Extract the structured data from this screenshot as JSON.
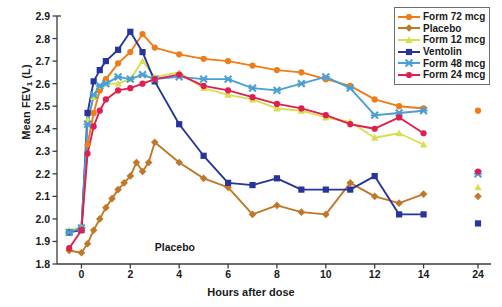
{
  "chart_data": {
    "type": "line",
    "title": "",
    "xlabel": "Hours after dose",
    "ylabel": "Mean FEV1 (L)",
    "ylabel_plain": "Mean FEV",
    "ylabel_sub": "1",
    "ylabel_unit": " (L)",
    "ylim": [
      1.8,
      2.9
    ],
    "yticks": [
      1.8,
      1.9,
      2.0,
      2.1,
      2.2,
      2.3,
      2.4,
      2.5,
      2.6,
      2.7,
      2.8,
      2.9
    ],
    "ytick_labels": [
      "1.8",
      "1.9",
      "2.0",
      "2.1",
      "2.2",
      "2.3",
      "2.4",
      "2.5",
      "2.6",
      "2.7",
      "2.8",
      "2.9"
    ],
    "xlim": [
      -1,
      15
    ],
    "xticks": [
      0,
      2,
      4,
      6,
      8,
      10,
      12,
      14
    ],
    "xtick_labels": [
      "0",
      "2",
      "4",
      "6",
      "8",
      "10",
      "12",
      "14"
    ],
    "xtick_break_label": "24",
    "axis_break": true,
    "grid": false,
    "legend_position": "top-right",
    "annotations": [
      {
        "text": "Placebo",
        "x": 3.0,
        "y": 1.87
      }
    ],
    "series": [
      {
        "name": "Form 72 mcg",
        "color": "#F07C18",
        "marker": "circle",
        "x": [
          -0.5,
          0,
          0.25,
          0.5,
          0.75,
          1,
          1.5,
          2,
          2.5,
          3,
          4,
          5,
          6,
          7,
          8,
          9,
          10,
          11,
          12,
          13,
          14
        ],
        "values": [
          1.94,
          1.96,
          2.33,
          2.47,
          2.57,
          2.62,
          2.69,
          2.74,
          2.82,
          2.76,
          2.73,
          2.71,
          2.7,
          2.68,
          2.66,
          2.65,
          2.62,
          2.59,
          2.53,
          2.5,
          2.49
        ],
        "point_24": 2.48
      },
      {
        "name": "Placebo",
        "color": "#C07828",
        "marker": "diamond",
        "x": [
          -0.5,
          0,
          0.25,
          0.5,
          0.75,
          1,
          1.25,
          1.5,
          1.75,
          2,
          2.25,
          2.5,
          2.75,
          3,
          4,
          5,
          6,
          7,
          8,
          9,
          10,
          11,
          12,
          13,
          14
        ],
        "values": [
          1.86,
          1.85,
          1.89,
          1.95,
          2.0,
          2.05,
          2.09,
          2.13,
          2.16,
          2.19,
          2.25,
          2.21,
          2.25,
          2.34,
          2.25,
          2.18,
          2.14,
          2.02,
          2.06,
          2.03,
          2.02,
          2.16,
          2.1,
          2.07,
          2.11
        ],
        "point_24": 2.1
      },
      {
        "name": "Form 12 mcg",
        "color": "#D8DE52",
        "marker": "triangle",
        "x": [
          -0.5,
          0,
          0.25,
          0.5,
          0.75,
          1,
          1.5,
          2,
          2.5,
          3,
          4,
          5,
          6,
          7,
          8,
          9,
          10,
          11,
          12,
          13,
          14
        ],
        "values": [
          1.95,
          1.96,
          2.44,
          2.54,
          2.59,
          2.6,
          2.6,
          2.62,
          2.7,
          2.63,
          2.65,
          2.58,
          2.55,
          2.53,
          2.49,
          2.48,
          2.45,
          2.43,
          2.36,
          2.38,
          2.33
        ],
        "point_24": 2.14
      },
      {
        "name": "Ventolin",
        "color": "#27349A",
        "marker": "square",
        "x": [
          -0.5,
          0,
          0.25,
          0.5,
          0.75,
          1,
          1.5,
          2,
          2.5,
          3,
          4,
          5,
          6,
          7,
          8,
          9,
          10,
          11,
          12,
          13,
          14
        ],
        "values": [
          1.94,
          1.95,
          2.47,
          2.61,
          2.66,
          2.7,
          2.75,
          2.83,
          2.74,
          2.61,
          2.42,
          2.28,
          2.16,
          2.15,
          2.18,
          2.13,
          2.13,
          2.13,
          2.19,
          2.02,
          2.02
        ],
        "point_24": 1.98
      },
      {
        "name": "Form 48 mcg",
        "color": "#4C9FD4",
        "marker": "cross",
        "x": [
          -0.5,
          0,
          0.25,
          0.5,
          0.75,
          1,
          1.5,
          2,
          2.5,
          3,
          4,
          5,
          6,
          7,
          8,
          9,
          10,
          11,
          12,
          13,
          14
        ],
        "values": [
          1.94,
          1.96,
          2.42,
          2.55,
          2.59,
          2.6,
          2.63,
          2.62,
          2.64,
          2.62,
          2.63,
          2.62,
          2.62,
          2.58,
          2.57,
          2.6,
          2.63,
          2.58,
          2.46,
          2.47,
          2.48
        ],
        "point_24": 2.2
      },
      {
        "name": "Form 24 mcg",
        "color": "#E01F50",
        "marker": "circle",
        "x": [
          -0.5,
          0,
          0.25,
          0.5,
          0.75,
          1,
          1.5,
          2,
          2.5,
          3,
          4,
          5,
          6,
          7,
          8,
          9,
          10,
          11,
          12,
          13,
          14
        ],
        "values": [
          1.87,
          1.95,
          2.29,
          2.41,
          2.48,
          2.53,
          2.57,
          2.58,
          2.6,
          2.62,
          2.64,
          2.59,
          2.57,
          2.54,
          2.51,
          2.49,
          2.46,
          2.42,
          2.4,
          2.45,
          2.38
        ],
        "point_24": 2.21
      }
    ]
  },
  "legend": {
    "items": [
      {
        "label": "Form 72 mcg"
      },
      {
        "label": "Placebo"
      },
      {
        "label": "Form 12 mcg"
      },
      {
        "label": "Ventolin"
      },
      {
        "label": "Form 48 mcg"
      },
      {
        "label": "Form 24 mcg"
      }
    ]
  }
}
